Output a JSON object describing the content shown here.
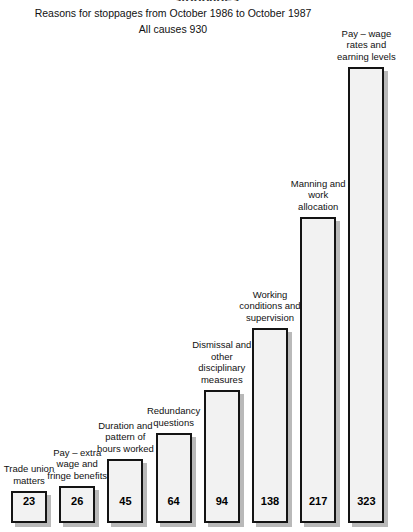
{
  "clipped_heading": "stoppages",
  "header": {
    "title": "Reasons for stoppages from October 1986 to October 1987",
    "subtitle": "All causes 930"
  },
  "chart_data": {
    "type": "bar",
    "title": "Reasons for stoppages from October 1986 to October 1987",
    "subtitle": "All causes 930",
    "xlabel": "",
    "ylabel": "",
    "ylim": [
      0,
      340
    ],
    "grid": false,
    "legend": "none",
    "orientation": "vertical",
    "total": 930,
    "categories": [
      "Trade union matters",
      "Pay – extra wage and fringe benefits",
      "Duration and pattern of hours worked",
      "Redundancy questions",
      "Dismissal and other disciplinary measures",
      "Working conditions and supervision",
      "Manning and work allocation",
      "Pay – wage rates and earning levels"
    ],
    "values": [
      23,
      26,
      45,
      64,
      94,
      138,
      217,
      323
    ],
    "bars": [
      {
        "label": "Trade union matters",
        "value": 23,
        "value_text": "23"
      },
      {
        "label": "Pay – extra wage and fringe benefits",
        "value": 26,
        "value_text": "26"
      },
      {
        "label": "Duration and pattern of hours worked",
        "value": 45,
        "value_text": "45"
      },
      {
        "label": "Redundancy questions",
        "value": 64,
        "value_text": "64"
      },
      {
        "label": "Dismissal and other disciplinary measures",
        "value": 94,
        "value_text": "94"
      },
      {
        "label": "Working conditions and supervision",
        "value": 138,
        "value_text": "138"
      },
      {
        "label": "Manning and work allocation",
        "value": 217,
        "value_text": "217"
      },
      {
        "label": "Pay – wage rates and earning levels",
        "value": 323,
        "value_text": "323"
      }
    ],
    "colors": {
      "bar_fill": "#f2f2f2",
      "bar_border": "#141414",
      "bar_shadow": "#b9b9b9",
      "text": "#111111",
      "background": "#ffffff"
    }
  }
}
